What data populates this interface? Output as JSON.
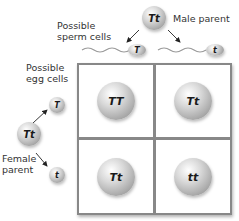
{
  "labels": {
    "possible_sperm": [
      "Possible",
      "sperm cells"
    ],
    "male_parent": "Male parent",
    "possible_egg": [
      "Possible",
      "egg cells"
    ],
    "female_parent": [
      "Female",
      "parent"
    ]
  },
  "male_parent_genotype": "Tt",
  "female_parent_genotype": "Tt",
  "sperm_alleles": [
    "T",
    "t"
  ],
  "egg_alleles": [
    "T",
    "t"
  ],
  "offspring": {
    "r0c0": "TT",
    "r0c1": "Tt",
    "r1c0": "Tt",
    "r1c1": "tt"
  }
}
